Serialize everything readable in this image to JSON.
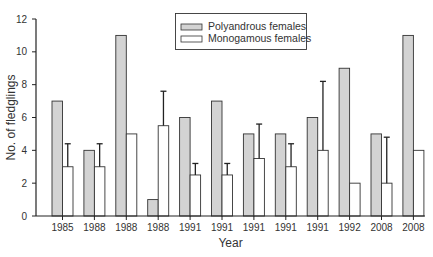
{
  "chart_data": {
    "type": "bar",
    "title": "",
    "xlabel": "Year",
    "ylabel": "No. of fledglings",
    "ylim": [
      0,
      12
    ],
    "yticks": [
      0,
      2,
      4,
      6,
      8,
      10,
      12
    ],
    "grid": false,
    "legend_position": "top-center",
    "categories": [
      "1985",
      "1988",
      "1988",
      "1988",
      "1991",
      "1991",
      "1991",
      "1991",
      "1991",
      "1992",
      "2008",
      "2008"
    ],
    "series": [
      {
        "name": "Polyandrous females",
        "color": "#d3d3d3",
        "values": [
          7,
          4,
          11,
          1,
          6,
          7,
          5,
          5,
          6,
          9,
          5,
          11
        ]
      },
      {
        "name": "Monogamous females",
        "color": "#ffffff",
        "values": [
          3,
          3,
          5,
          5.5,
          2.5,
          2.5,
          3.5,
          3,
          4,
          2,
          2,
          4
        ],
        "error_upper": [
          4.4,
          4.4,
          null,
          7.6,
          3.2,
          3.2,
          5.6,
          4.4,
          8.2,
          null,
          4.8,
          null
        ]
      }
    ]
  }
}
